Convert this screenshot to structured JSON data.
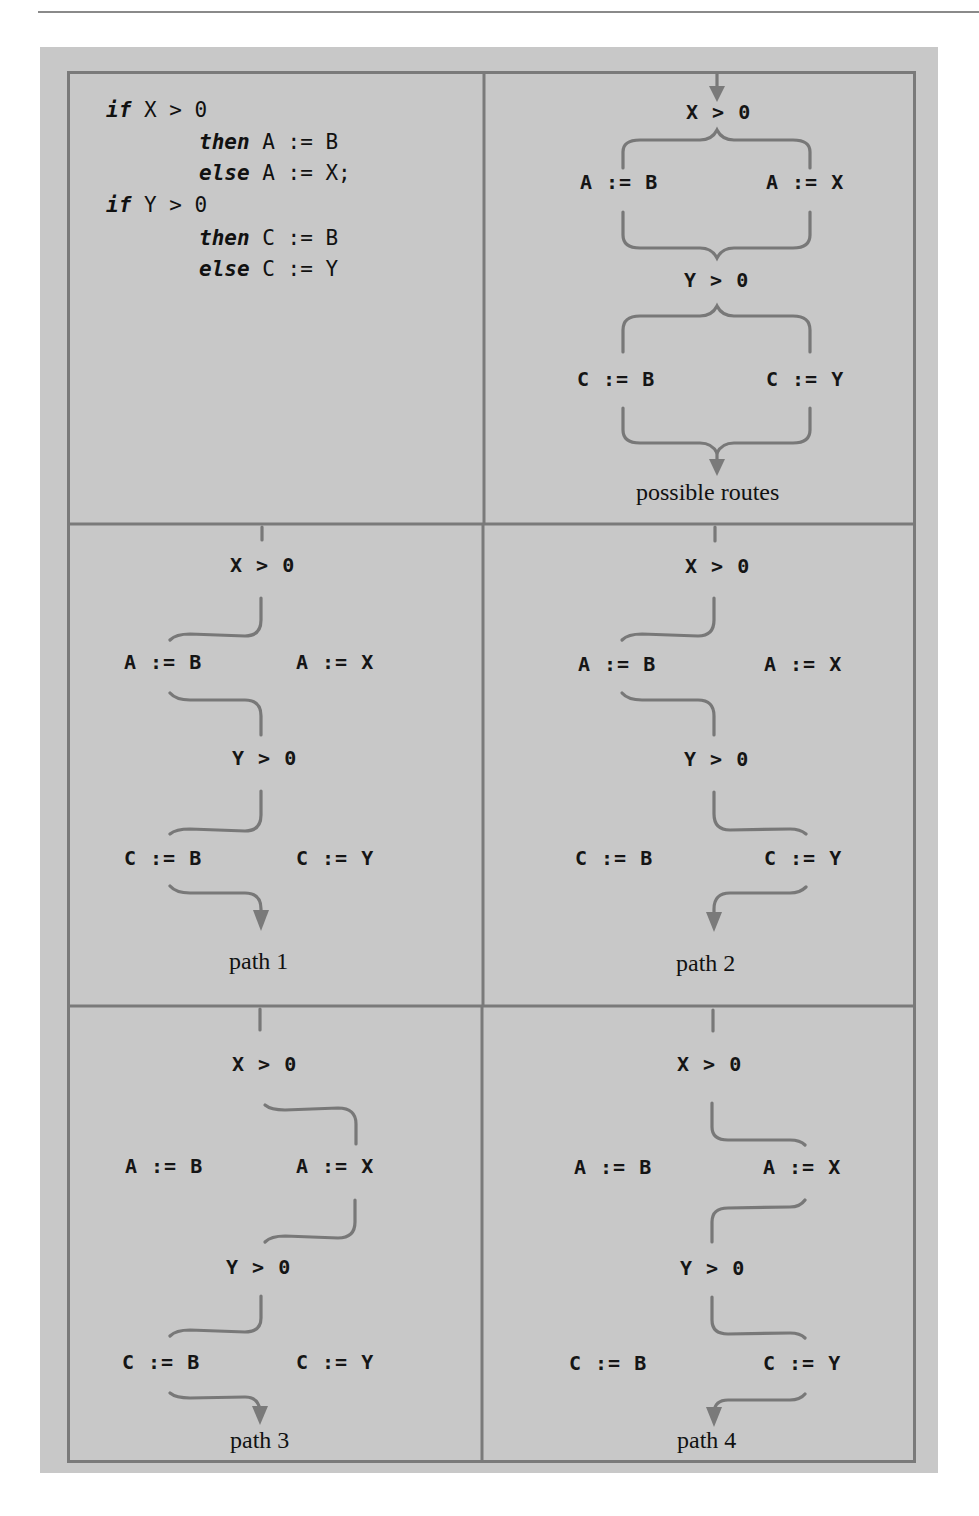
{
  "figure": {
    "colors": {
      "background": "#c8c8c8",
      "frame": "#7a7a7a",
      "curve": "#777777",
      "text": "#111111"
    },
    "code": {
      "lines": [
        {
          "keyword": "if",
          "rest": " X > 0",
          "indent": 0
        },
        {
          "keyword": "then",
          "rest": " A := B",
          "indent": 1
        },
        {
          "keyword": "else",
          "rest": " A := X;",
          "indent": 1
        },
        {
          "keyword": "if",
          "rest": " Y > 0",
          "indent": 0
        },
        {
          "keyword": "then",
          "rest": " C := B",
          "indent": 1
        },
        {
          "keyword": "else",
          "rest": " C := Y",
          "indent": 1
        }
      ]
    },
    "routes": {
      "label": "possible routes",
      "cond1": "X > 0",
      "a_then": "A := B",
      "a_else": "A := X",
      "cond2": "Y > 0",
      "c_then": "C := B",
      "c_else": "C := Y"
    },
    "paths": [
      {
        "label": "path 1",
        "cond1": "X > 0",
        "a_then": "A := B",
        "a_else": "A := X",
        "cond2": "Y > 0",
        "c_then": "C := B",
        "c_else": "C := Y",
        "first_branch": "then",
        "second_branch": "then"
      },
      {
        "label": "path 2",
        "cond1": "X > 0",
        "a_then": "A := B",
        "a_else": "A := X",
        "cond2": "Y > 0",
        "c_then": "C := B",
        "c_else": "C := Y",
        "first_branch": "then",
        "second_branch": "else"
      },
      {
        "label": "path 3",
        "cond1": "X > 0",
        "a_then": "A := B",
        "a_else": "A := X",
        "cond2": "Y > 0",
        "c_then": "C := B",
        "c_else": "C := Y",
        "first_branch": "else",
        "second_branch": "then"
      },
      {
        "label": "path 4",
        "cond1": "X > 0",
        "a_then": "A := B",
        "a_else": "A := X",
        "cond2": "Y > 0",
        "c_then": "C := B",
        "c_else": "C := Y",
        "first_branch": "else",
        "second_branch": "else"
      }
    ]
  }
}
